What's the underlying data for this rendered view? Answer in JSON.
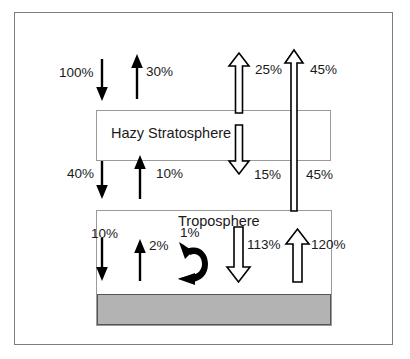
{
  "diagram": {
    "layers": [
      {
        "id": "stratosphere",
        "label": "Hazy Stratosphere"
      },
      {
        "id": "troposphere",
        "label": "Troposphere"
      },
      {
        "id": "ground",
        "label": ""
      }
    ],
    "colors": {
      "frame_border": "#7d7d7d",
      "box_border": "#9a9a9a",
      "ground_fill": "#b3b3b3",
      "arrow_solid": "#000000",
      "arrow_hollow_stroke": "#000000",
      "arrow_hollow_fill": "#ffffff",
      "text": "#1a1a1a"
    },
    "flows": [
      {
        "id": "incoming-solar",
        "value": "100%",
        "direction": "down",
        "style": "solid",
        "destination": "stratosphere-top"
      },
      {
        "id": "reflected-solar",
        "value": "30%",
        "direction": "up",
        "style": "solid",
        "destination": "space"
      },
      {
        "id": "stratosphere-emission-up",
        "value": "25%",
        "direction": "up",
        "style": "hollow",
        "destination": "space"
      },
      {
        "id": "surface-window-to-space",
        "value": "45%",
        "direction": "up",
        "style": "hollow-thin",
        "destination": "space"
      },
      {
        "id": "solar-to-troposphere",
        "value": "40%",
        "direction": "down",
        "style": "solid",
        "destination": "troposphere-top"
      },
      {
        "id": "troposphere-reflected",
        "value": "10%",
        "direction": "up",
        "style": "solid",
        "destination": "stratosphere-bottom"
      },
      {
        "id": "stratosphere-emission-down",
        "value": "15%",
        "direction": "down",
        "style": "hollow",
        "destination": "troposphere-top"
      },
      {
        "id": "window-midlabel",
        "value": "45%",
        "direction": "up",
        "style": "label-only",
        "destination": "space"
      },
      {
        "id": "solar-to-surface",
        "value": "10%",
        "direction": "down",
        "style": "solid",
        "destination": "ground"
      },
      {
        "id": "surface-reflected",
        "value": "2%",
        "direction": "up",
        "style": "solid",
        "destination": "troposphere"
      },
      {
        "id": "latent-sensible-heat",
        "value": "1%",
        "direction": "curved",
        "style": "solid-curved",
        "destination": "troposphere"
      },
      {
        "id": "back-radiation",
        "value": "113%",
        "direction": "down",
        "style": "hollow",
        "destination": "ground"
      },
      {
        "id": "surface-emission",
        "value": "120%",
        "direction": "up",
        "style": "hollow",
        "destination": "troposphere"
      }
    ],
    "labels": {
      "v100": "100%",
      "v30": "30%",
      "v25": "25%",
      "v45_top": "45%",
      "v40": "40%",
      "v10_mid": "10%",
      "v15": "15%",
      "v45_mid": "45%",
      "v10_low": "10%",
      "v2": "2%",
      "v1": "1%",
      "v113": "113%",
      "v120": "120%",
      "stratosphere": "Hazy Stratosphere",
      "troposphere": "Troposphere"
    }
  }
}
